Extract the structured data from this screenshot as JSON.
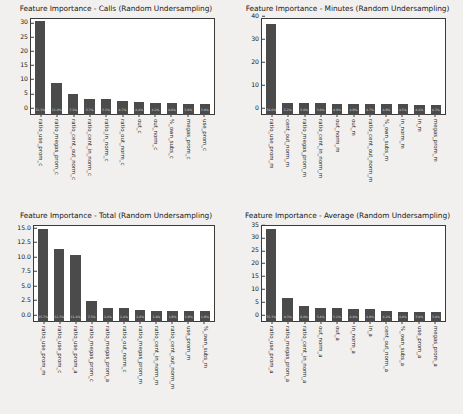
{
  "figure": {
    "background_color": "#f2f0ee",
    "bar_color": "#4b4b4b",
    "axes_background": "#ffffff",
    "text_color": "#1a1a1a"
  },
  "chart_data": [
    {
      "type": "bar",
      "title": "Feature Importance - Calls (Random Undersampling)",
      "xlabel": "",
      "ylabel": "",
      "ylim": [
        0,
        33.5
      ],
      "yticks": [
        "0",
        "5",
        "10",
        "15",
        "20",
        "25",
        "30"
      ],
      "ytick_values": [
        0,
        5,
        10,
        15,
        20,
        25,
        30
      ],
      "grid": false,
      "legend": "none",
      "categories": [
        "ratio_use_prom_c",
        "ratio_megas_prom_c",
        "ratio_cent_out_norm_c",
        "ratio_cent_in_norm_c",
        "ratio_in_norm_c",
        "ratio_out_norm_c",
        "out_c",
        "out_norm_c",
        "%_own_subs_c",
        "megas_prom_c",
        "use_prom_c"
      ],
      "values": [
        32.3,
        11.0,
        7.1,
        5.7,
        5.5,
        4.7,
        4.4,
        4.2,
        4.0,
        3.9,
        3.9
      ],
      "bar_labels": [
        "32.3%",
        "11.0%",
        "7.1%",
        "5.7%",
        "5.5%",
        "4.7%",
        "4.4%",
        "4.2%",
        "4.0%",
        "3.9%",
        "3.9%"
      ]
    },
    {
      "type": "bar",
      "title": "Feature Importance - Minutes (Random Undersampling)",
      "xlabel": "",
      "ylabel": "",
      "ylim": [
        0,
        41.5
      ],
      "yticks": [
        "0",
        "10",
        "20",
        "30",
        "40"
      ],
      "ytick_values": [
        0,
        10,
        20,
        30,
        40
      ],
      "grid": false,
      "legend": "none",
      "categories": [
        "ratio_use_prom_m",
        "cent_out_norm_m",
        "ratio_megas_prom_m",
        "ratio_cent_in_norm_m",
        "out_norm_m",
        "out_m",
        "ratio_cent_out_norm_m",
        "%_own_subs_m",
        "in_norm_m",
        "in_m",
        "megas_prom_m"
      ],
      "values": [
        39.0,
        5.2,
        5.0,
        5.0,
        4.9,
        4.8,
        4.7,
        4.6,
        4.5,
        4.4,
        4.3
      ],
      "bar_labels": [
        "39.0%",
        "5.2%",
        "5.0%",
        "5.0%",
        "4.9%",
        "4.8%",
        "4.7%",
        "4.6%",
        "4.5%",
        "4.4%",
        "4.3%"
      ]
    },
    {
      "type": "bar",
      "title": "Feature Importance - Total (Random Undersampling)",
      "xlabel": "",
      "ylabel": "",
      "ylim": [
        0,
        16.4
      ],
      "yticks": [
        "0.0",
        "2.5",
        "5.0",
        "7.5",
        "10.0",
        "12.5",
        "15.0"
      ],
      "ytick_values": [
        0.0,
        2.5,
        5.0,
        7.5,
        10.0,
        12.5,
        15.0
      ],
      "grid": false,
      "legend": "none",
      "categories": [
        "ratio_use_prom_m",
        "ratio_use_prom_c",
        "ratio_use_prom_a",
        "ratio_megas_prom_c",
        "ratio_megas_prom_a",
        "ratio_out_norm_c",
        "ratio_megas_prom_m",
        "ratio_cent_in_norm_m",
        "ratio_cent_out_norm_m",
        "use_prom_m",
        "%_own_subs_m"
      ],
      "values": [
        15.7,
        12.3,
        11.4,
        3.5,
        2.4,
        2.4,
        2.0,
        1.9,
        1.8,
        1.8,
        1.8
      ],
      "bar_labels": [
        "15.7%",
        "12.3%",
        "11.4%",
        "3.5%",
        "2.4%",
        "2.4%",
        "2.0%",
        "1.9%",
        "1.8%",
        "1.8%",
        "1.8%"
      ]
    },
    {
      "type": "bar",
      "title": "Feature Importance - Average (Random Undersampling)",
      "xlabel": "",
      "ylabel": "",
      "ylim": [
        0,
        37.0
      ],
      "yticks": [
        "0",
        "5",
        "10",
        "15",
        "20",
        "25",
        "30",
        "35"
      ],
      "ytick_values": [
        0,
        5,
        10,
        15,
        20,
        25,
        30,
        35
      ],
      "grid": false,
      "legend": "none",
      "categories": [
        "ratio_use_prom_a",
        "ratio_megas_prom_a",
        "ratio_cent_in_norm_a",
        "out_norm_a",
        "out_a",
        "in_norm_a",
        "in_a",
        "cent_out_norm_a",
        "%_own_subs_a",
        "use_prom_a",
        "megas_prom_a"
      ],
      "values": [
        35.3,
        9.3,
        6.0,
        5.4,
        5.2,
        4.9,
        4.9,
        4.2,
        4.0,
        3.9,
        3.9
      ],
      "bar_labels": [
        "35.3%",
        "9.3%",
        "6.0%",
        "5.4%",
        "5.2%",
        "4.9%",
        "4.9%",
        "4.2%",
        "4.0%",
        "3.9%",
        "3.9%"
      ]
    }
  ]
}
